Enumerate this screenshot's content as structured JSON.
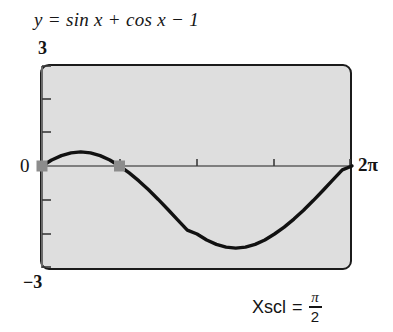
{
  "title": {
    "lhs": "y",
    "eq": "=",
    "rhs": "sin x + cos x − 1",
    "full": "y = sin x + cos x − 1"
  },
  "labels": {
    "y_max": "3",
    "y_min": "−3",
    "origin": "0",
    "x_max": "2π"
  },
  "annotation": {
    "name": "Xscl",
    "equals": "=",
    "numerator": "π",
    "denominator": "2",
    "full": "Xscl = π/2"
  },
  "colors": {
    "plot_background": "#dedede",
    "frame": "#1b1b1b",
    "curve": "#111111",
    "axis": "#6a6a6a",
    "marker": "#8c8c8c",
    "text": "#141414",
    "page_background": "#ffffff"
  },
  "chart_data": {
    "type": "line",
    "title": "y = sin x + cos x − 1",
    "xlabel": "",
    "ylabel": "",
    "xlim": [
      0,
      6.283185307179586
    ],
    "ylim": [
      -3,
      3
    ],
    "xscl": 1.5707963267948966,
    "yscl": 1,
    "xtick_labels": [
      "0",
      "2π"
    ],
    "ytick_labels": [
      "3",
      "0",
      "−3"
    ],
    "grid": false,
    "legend": null,
    "expression": "sin(x) + cos(x) - 1",
    "series": [
      {
        "name": "y = sin x + cos x − 1",
        "x": [
          0.0,
          0.1963,
          0.3927,
          0.589,
          0.7854,
          0.9817,
          1.1781,
          1.3744,
          1.5708,
          1.7671,
          1.9635,
          2.1598,
          2.3562,
          2.5525,
          2.7489,
          2.9452,
          3.1416,
          3.3379,
          3.5343,
          3.7306,
          3.927,
          4.1233,
          4.3197,
          4.516,
          4.7124,
          4.9087,
          5.1051,
          5.3014,
          5.4978,
          5.6941,
          5.8905,
          6.0868,
          6.2832
        ],
        "y": [
          0.0,
          0.1764,
          0.3066,
          0.3869,
          0.4142,
          0.3869,
          0.3066,
          0.1764,
          0.0,
          -0.2027,
          -0.4379,
          -0.7003,
          -0.9836,
          -1.2806,
          -1.5839,
          -1.8856,
          -2.0,
          -2.1764,
          -2.3066,
          -2.3869,
          -2.4142,
          -2.3869,
          -2.3066,
          -2.1764,
          -2.0,
          -1.7973,
          -1.5621,
          -1.2997,
          -1.0164,
          -0.7194,
          -0.4161,
          -0.1144,
          0.0
        ]
      }
    ],
    "marked_points": [
      {
        "label": "x-intercept",
        "x": 0.0,
        "y": 0.0
      },
      {
        "label": "x-intercept",
        "x": 1.5707963267948966,
        "y": 0.0
      }
    ],
    "extrema": [
      {
        "label": "maximum",
        "x": 0.7854,
        "y": 0.4142
      },
      {
        "label": "minimum",
        "x": 3.927,
        "y": -2.4142
      }
    ]
  }
}
